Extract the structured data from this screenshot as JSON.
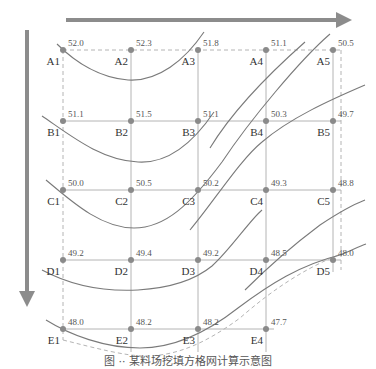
{
  "figure": {
    "caption": "图 ·· 某料场挖填方格网计算示意图",
    "colors": {
      "arrow": "#8c8c8c",
      "grid_line": "#b4b4b4",
      "boundary_dashed": "#b4b4b4",
      "contour": "#7a7a7a",
      "dot": "#8a8a8a"
    },
    "arrows": {
      "horizontal": {
        "x1": 66,
        "y1": 20,
        "x2": 352,
        "y2": 20,
        "direction": "right"
      },
      "vertical": {
        "x1": 27,
        "y1": 30,
        "x2": 27,
        "y2": 307,
        "direction": "down"
      }
    },
    "grid": {
      "columns_x": [
        63,
        131,
        198,
        266,
        333
      ],
      "rows_y": [
        50,
        121,
        190,
        260,
        329
      ],
      "boundary": {
        "x_left": 63,
        "x_right": 341,
        "y_top": 50,
        "y_bottom": 342
      }
    },
    "points": [
      {
        "id": "A1",
        "row": 0,
        "col": 0,
        "value": "52.0"
      },
      {
        "id": "A2",
        "row": 0,
        "col": 1,
        "value": "52.3"
      },
      {
        "id": "A3",
        "row": 0,
        "col": 2,
        "value": "51.8"
      },
      {
        "id": "A4",
        "row": 0,
        "col": 3,
        "value": "51.1"
      },
      {
        "id": "A5",
        "row": 0,
        "col": 4,
        "value": "50.5"
      },
      {
        "id": "B1",
        "row": 1,
        "col": 0,
        "value": "51.1"
      },
      {
        "id": "B2",
        "row": 1,
        "col": 1,
        "value": "51.5"
      },
      {
        "id": "B3",
        "row": 1,
        "col": 2,
        "value": "51.1"
      },
      {
        "id": "B4",
        "row": 1,
        "col": 3,
        "value": "50.3"
      },
      {
        "id": "B5",
        "row": 1,
        "col": 4,
        "value": "49.7"
      },
      {
        "id": "C1",
        "row": 2,
        "col": 0,
        "value": "50.0"
      },
      {
        "id": "C2",
        "row": 2,
        "col": 1,
        "value": "50.5"
      },
      {
        "id": "C3",
        "row": 2,
        "col": 2,
        "value": "50.2"
      },
      {
        "id": "C4",
        "row": 2,
        "col": 3,
        "value": "49.3"
      },
      {
        "id": "C5",
        "row": 2,
        "col": 4,
        "value": "48.8"
      },
      {
        "id": "D1",
        "row": 3,
        "col": 0,
        "value": "49.2"
      },
      {
        "id": "D2",
        "row": 3,
        "col": 1,
        "value": "49.4"
      },
      {
        "id": "D3",
        "row": 3,
        "col": 2,
        "value": "49.2"
      },
      {
        "id": "D4",
        "row": 3,
        "col": 3,
        "value": "48.5"
      },
      {
        "id": "D5",
        "row": 3,
        "col": 4,
        "value": "48.0"
      },
      {
        "id": "E1",
        "row": 4,
        "col": 0,
        "value": "48.0"
      },
      {
        "id": "E2",
        "row": 4,
        "col": 1,
        "value": "48.2"
      },
      {
        "id": "E3",
        "row": 4,
        "col": 2,
        "value": "48.2"
      },
      {
        "id": "E4",
        "row": 4,
        "col": 3,
        "value": "47.7"
      }
    ],
    "contours": [
      {
        "name": "contour-a-row",
        "d": "M57 44 C 75 62, 100 78, 128 80 C 158 82, 185 60, 204 32"
      },
      {
        "name": "contour-a4",
        "d": "M210 148 C 230 115, 262 80, 305 42"
      },
      {
        "name": "contour-b-row",
        "d": "M42 116 C 70 135, 100 160, 138 162 C 170 164, 195 140, 214 112"
      },
      {
        "name": "contour-b5",
        "d": "M190 230 C 215 200, 240 160, 262 142 C 290 118, 330 100, 365 85"
      },
      {
        "name": "contour-c-row",
        "d": "M46 180 C 70 200, 100 228, 134 228 C 165 228, 190 205, 222 162 C 250 120, 300 60, 330 34"
      },
      {
        "name": "contour-c5",
        "d": "M245 290 C 270 265, 300 240, 320 225 C 338 213, 352 205, 365 200"
      },
      {
        "name": "contour-d-row",
        "d": "M42 270 C 70 285, 100 292, 138 290 C 170 288, 195 280, 212 266 C 230 250, 250 220, 262 210"
      },
      {
        "name": "contour-e-row",
        "d": "M46 320 C 70 335, 105 348, 140 348 C 175 348, 210 330, 238 308 C 270 284, 300 265, 340 255 C 352 250, 360 246, 366 244"
      }
    ],
    "dashed_bottom": {
      "d": "M63 340 C 95 348, 125 356, 145 356 C 180 356, 210 340, 240 318 C 272 290, 305 268, 341 254"
    }
  }
}
